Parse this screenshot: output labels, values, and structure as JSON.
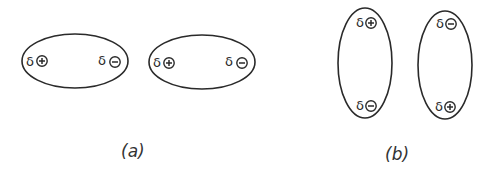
{
  "diagram": {
    "panels": [
      {
        "caption": "(a)",
        "orientation": "horizontal",
        "molecules": [
          {
            "pole_left": {
              "delta": "δ",
              "charge": "+"
            },
            "pole_right": {
              "delta": "δ",
              "charge": "−"
            }
          },
          {
            "pole_left": {
              "delta": "δ",
              "charge": "+"
            },
            "pole_right": {
              "delta": "δ",
              "charge": "−"
            }
          }
        ]
      },
      {
        "caption": "(b)",
        "orientation": "vertical",
        "molecules": [
          {
            "pole_top": {
              "delta": "δ",
              "charge": "+"
            },
            "pole_bottom": {
              "delta": "δ",
              "charge": "−"
            }
          },
          {
            "pole_top": {
              "delta": "δ",
              "charge": "−"
            },
            "pole_bottom": {
              "delta": "δ",
              "charge": "+"
            }
          }
        ]
      }
    ],
    "colors": {
      "stroke": "#2a2a2a",
      "background": "#ffffff"
    }
  }
}
